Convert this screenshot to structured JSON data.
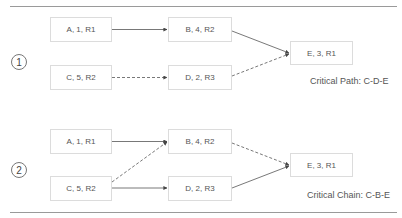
{
  "diagram": {
    "scenarios": [
      {
        "number": "1",
        "tasks": {
          "A": "A, 1, R1",
          "B": "B, 4, R2",
          "C": "C, 5, R2",
          "D": "D, 2, R3",
          "E": "E, 3, R1"
        },
        "edges": [
          {
            "from": "A",
            "to": "B",
            "style": "solid"
          },
          {
            "from": "C",
            "to": "D",
            "style": "dashed"
          },
          {
            "from": "B",
            "to": "E",
            "style": "solid"
          },
          {
            "from": "D",
            "to": "E",
            "style": "dashed"
          }
        ],
        "caption": "Critical Path: C-D-E"
      },
      {
        "number": "2",
        "tasks": {
          "A": "A, 1, R1",
          "B": "B, 4, R2",
          "C": "C, 5, R2",
          "D": "D, 2, R3",
          "E": "E, 3, R1"
        },
        "edges": [
          {
            "from": "A",
            "to": "B",
            "style": "solid"
          },
          {
            "from": "C",
            "to": "B",
            "style": "dashed"
          },
          {
            "from": "C",
            "to": "D",
            "style": "solid"
          },
          {
            "from": "B",
            "to": "E",
            "style": "dashed"
          },
          {
            "from": "D",
            "to": "E",
            "style": "solid"
          }
        ],
        "caption": "Critical Chain: C-B-E"
      }
    ]
  },
  "colors": {
    "line": "#555555",
    "box_border": "#dcdcdc",
    "rule": "#9a9a9a"
  }
}
